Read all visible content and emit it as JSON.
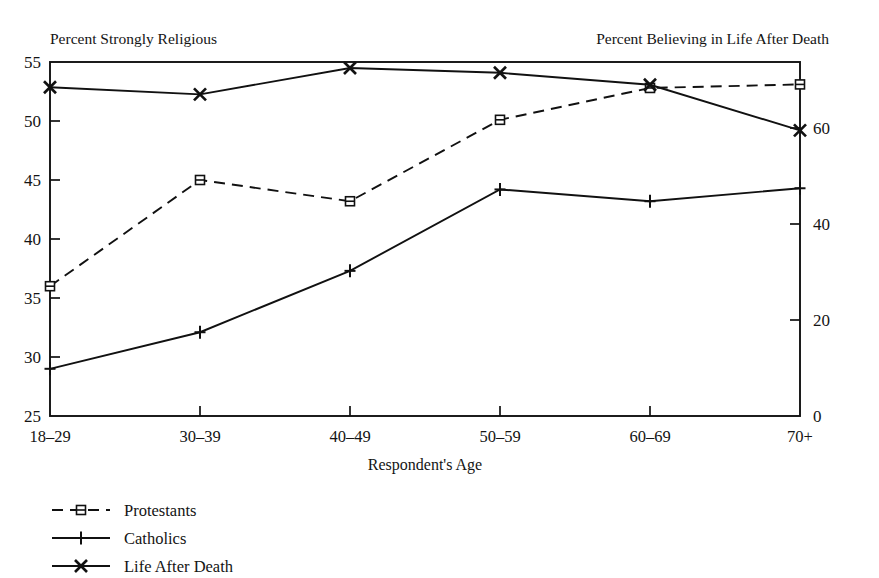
{
  "chart_data": {
    "type": "line",
    "title": "",
    "left_axis_title": "Percent Strongly Religious",
    "right_axis_title": "Percent Believing in Life After Death",
    "xlabel": "Respondent's Age",
    "categories": [
      "18–29",
      "30–39",
      "40–49",
      "50–59",
      "60–69",
      "70+"
    ],
    "left_ticks": [
      "25",
      "30",
      "35",
      "40",
      "45",
      "50",
      "55"
    ],
    "left_tick_values": [
      25,
      30,
      35,
      40,
      45,
      50,
      55
    ],
    "right_ticks": [
      "0",
      "20",
      "40",
      "60"
    ],
    "right_tick_values": [
      0,
      20,
      40,
      60
    ],
    "ylim_left": [
      25,
      55
    ],
    "ylim_right": [
      0,
      73.75
    ],
    "grid": false,
    "legend_position": "below-left",
    "series": [
      {
        "name": "Protestants",
        "axis": "left",
        "marker": "square",
        "dashed": true,
        "values": [
          36.0,
          45.0,
          43.2,
          50.1,
          52.8,
          53.1
        ]
      },
      {
        "name": "Catholics",
        "axis": "left",
        "marker": "plus",
        "dashed": false,
        "values": [
          29.0,
          32.1,
          37.3,
          44.2,
          43.2,
          44.3
        ]
      },
      {
        "name": "Life After Death",
        "axis": "right",
        "marker": "x",
        "dashed": false,
        "values": [
          68.5,
          67.0,
          72.5,
          71.5,
          69.0,
          59.5
        ]
      }
    ],
    "legend": [
      {
        "label": "Protestants",
        "marker": "square",
        "dashed": true
      },
      {
        "label": "Catholics",
        "marker": "plus",
        "dashed": false
      },
      {
        "label": "Life After Death",
        "marker": "x",
        "dashed": false
      }
    ]
  }
}
